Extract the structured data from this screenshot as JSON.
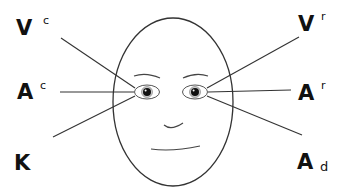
{
  "diagram": {
    "title": "",
    "face": {
      "description": "oval face with two eyes, eyebrows, nose and mouth"
    },
    "labels": [
      {
        "id": "vc",
        "main": "V",
        "sup": "c",
        "side": "left",
        "target": "left-eye"
      },
      {
        "id": "ac",
        "main": "A",
        "sup": "c",
        "side": "left",
        "target": "left-eye"
      },
      {
        "id": "k",
        "main": "K",
        "side": "left",
        "target": "left-eye"
      },
      {
        "id": "vr",
        "main": "V",
        "sup": "r",
        "side": "right",
        "target": "right-eye"
      },
      {
        "id": "ar",
        "main": "A",
        "sup": "r",
        "side": "right",
        "target": "right-eye"
      },
      {
        "id": "ad",
        "main": "A",
        "sub": "d",
        "side": "right",
        "target": "right-eye"
      }
    ],
    "colors": {
      "line": "#333333",
      "text": "#111111",
      "background": "#ffffff"
    }
  }
}
